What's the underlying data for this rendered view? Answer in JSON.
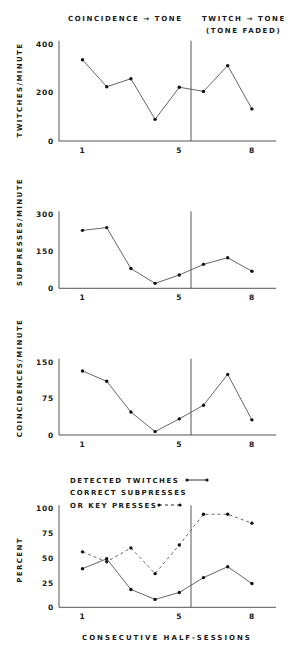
{
  "header": {
    "left": "COINCIDENCE → TONE",
    "right_line1": "TWITCH → TONE",
    "right_line2": "(TONE  FADED)"
  },
  "x_axis_label": "CONSECUTIVE  HALF-SESSIONS",
  "colors": {
    "ink": "#1a1a1a",
    "line": "#555555",
    "background": "#ffffff"
  },
  "chart_data": [
    {
      "type": "line",
      "title": "",
      "ylabel": "TWITCHES/MINUTE",
      "xlabel": "",
      "x": [
        1,
        2,
        3,
        4,
        5,
        6,
        7,
        8
      ],
      "x_tick_labels": [
        "1",
        "5",
        "8"
      ],
      "ylim": [
        0,
        400
      ],
      "y_ticks": [
        0,
        200,
        400
      ],
      "phase_divider_after_x": 5.5,
      "phases": [
        "COINCIDENCE → TONE",
        "TWITCH → TONE (TONE FADED)"
      ],
      "series": [
        {
          "name": "Twitches/minute",
          "style": "solid",
          "values": [
            334,
            223,
            256,
            89,
            221,
            204,
            310,
            132
          ]
        }
      ]
    },
    {
      "type": "line",
      "title": "",
      "ylabel": "SUBPRESSES/MINUTE",
      "xlabel": "",
      "x": [
        1,
        2,
        3,
        4,
        5,
        6,
        7,
        8
      ],
      "x_tick_labels": [
        "1",
        "5",
        "8"
      ],
      "ylim": [
        0,
        300
      ],
      "y_ticks": [
        0,
        150,
        300
      ],
      "phase_divider_after_x": 5.5,
      "series": [
        {
          "name": "Subpresses/minute",
          "style": "solid",
          "values": [
            235,
            246,
            80,
            20,
            54,
            97,
            124,
            69
          ]
        }
      ]
    },
    {
      "type": "line",
      "title": "",
      "ylabel": "COINCIDENCES/MINUTE",
      "xlabel": "",
      "x": [
        1,
        2,
        3,
        4,
        5,
        6,
        7,
        8
      ],
      "x_tick_labels": [
        "1",
        "5",
        "8"
      ],
      "ylim": [
        0,
        150
      ],
      "y_ticks": [
        0,
        75,
        150
      ],
      "phase_divider_after_x": 5.5,
      "series": [
        {
          "name": "Coincidences/minute",
          "style": "solid",
          "values": [
            131,
            110,
            47,
            7,
            33,
            61,
            124,
            31
          ]
        }
      ]
    },
    {
      "type": "line",
      "title": "",
      "ylabel": "PERCENT",
      "xlabel": "CONSECUTIVE HALF-SESSIONS",
      "x": [
        1,
        2,
        3,
        4,
        5,
        6,
        7,
        8
      ],
      "x_tick_labels": [
        "1",
        "5",
        "8"
      ],
      "ylim": [
        0,
        100
      ],
      "y_ticks": [
        0,
        25,
        50,
        75,
        100
      ],
      "phase_divider_after_x": 5.5,
      "legend_position": "top-left",
      "legend": [
        "DETECTED TWITCHES",
        "CORRECT SUBPRESSES OR KEY PRESSES"
      ],
      "series": [
        {
          "name": "DETECTED TWITCHES",
          "style": "solid",
          "values": [
            39,
            49,
            18,
            8,
            15,
            30,
            41,
            24
          ]
        },
        {
          "name": "CORRECT SUBPRESSES OR KEY PRESSES",
          "style": "dashed",
          "values": [
            56,
            46,
            60,
            34,
            63,
            94,
            94,
            85
          ]
        }
      ]
    }
  ],
  "legend": {
    "line1": "DETECTED TWITCHES",
    "line2": "CORRECT SUBPRESSES",
    "line3": "OR KEY PRESSES"
  }
}
